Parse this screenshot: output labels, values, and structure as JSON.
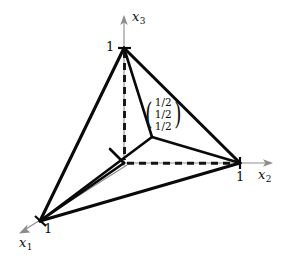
{
  "figure": {
    "background_color": "#ffffff",
    "ink_color": "#0a0a0a",
    "axis_color": "#8d8d8d"
  },
  "axes": [
    {
      "id": "x1",
      "label": "x",
      "subscript": "1",
      "tick_label": "1",
      "direction": "down-left"
    },
    {
      "id": "x2",
      "label": "x",
      "subscript": "2",
      "tick_label": "1",
      "direction": "right"
    },
    {
      "id": "x3",
      "label": "x",
      "subscript": "3",
      "tick_label": "1",
      "direction": "up"
    }
  ],
  "annotation": {
    "type": "column-vector",
    "open_paren": "(",
    "close_paren": ")",
    "components": [
      "1/2",
      "1/2",
      "1/2"
    ]
  },
  "geometry": {
    "origin": {
      "x": 124,
      "y": 163
    },
    "vertices": [
      {
        "name": "e3-vertex",
        "x": 124,
        "y": 48
      },
      {
        "name": "e2-vertex",
        "x": 240,
        "y": 163
      },
      {
        "name": "e1-vertex",
        "x": 40,
        "y": 221
      },
      {
        "name": "center-point",
        "x": 152,
        "y": 137
      }
    ]
  }
}
